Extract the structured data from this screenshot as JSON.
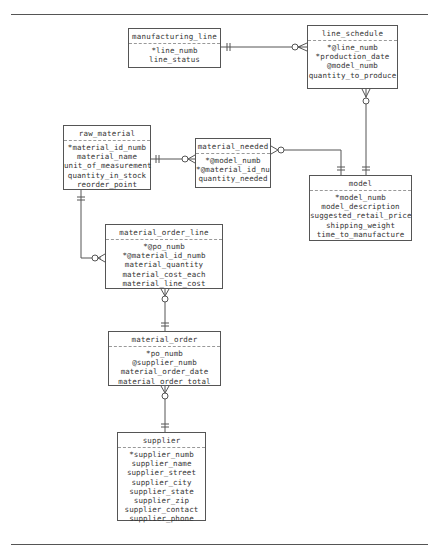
{
  "diagram": {
    "type": "entity-relationship",
    "notation": "crows-foot",
    "entities": [
      {
        "id": "manufacturing_line",
        "title": "manufacturing_line",
        "attributes": [
          "*line_numb",
          "line_status"
        ]
      },
      {
        "id": "line_schedule",
        "title": "line_schedule",
        "attributes": [
          "*@line_numb",
          "*production_date",
          "@model_numb",
          "quantity_to_produce"
        ]
      },
      {
        "id": "raw_material",
        "title": "raw_material",
        "attributes": [
          "*material_id_numb",
          "material_name",
          "unit_of_measurement",
          "quantity_in_stock",
          "reorder_point"
        ]
      },
      {
        "id": "material_needed",
        "title": "material_needed",
        "attributes": [
          "*@model_numb",
          "*@material_id_nu",
          "quantity_needed"
        ]
      },
      {
        "id": "model",
        "title": "model",
        "attributes": [
          "*model_numb",
          "model_description",
          "suggested_retail_price",
          "shipping_weight",
          "time_to_manufacture"
        ]
      },
      {
        "id": "material_order_line",
        "title": "material_order_line",
        "attributes": [
          "*@po_numb",
          "*@material_id_numb",
          "material_quantity",
          "material_cost_each",
          "material_line_cost"
        ]
      },
      {
        "id": "material_order",
        "title": "material_order",
        "attributes": [
          "*po_numb",
          "@supplier_numb",
          "material_order_date",
          "material_order_total"
        ]
      },
      {
        "id": "supplier",
        "title": "supplier",
        "attributes": [
          "*supplier_numb",
          "supplier_name",
          "supplier_street",
          "supplier_city",
          "supplier_state",
          "supplier_zip",
          "supplier_contact",
          "supplier_phone"
        ]
      }
    ],
    "relationships": [
      {
        "from": "manufacturing_line",
        "to": "line_schedule",
        "from_cardinality": "one-and-only-one",
        "to_cardinality": "zero-or-many"
      },
      {
        "from": "model",
        "to": "line_schedule",
        "from_cardinality": "one-and-only-one",
        "to_cardinality": "zero-or-many"
      },
      {
        "from": "raw_material",
        "to": "material_needed",
        "from_cardinality": "one-and-only-one",
        "to_cardinality": "zero-or-many"
      },
      {
        "from": "model",
        "to": "material_needed",
        "from_cardinality": "one-and-only-one",
        "to_cardinality": "zero-or-many"
      },
      {
        "from": "raw_material",
        "to": "material_order_line",
        "from_cardinality": "one-and-only-one",
        "to_cardinality": "zero-or-many"
      },
      {
        "from": "material_order",
        "to": "material_order_line",
        "from_cardinality": "one-and-only-one",
        "to_cardinality": "zero-or-many"
      },
      {
        "from": "supplier",
        "to": "material_order",
        "from_cardinality": "one-and-only-one",
        "to_cardinality": "zero-or-many"
      }
    ]
  }
}
